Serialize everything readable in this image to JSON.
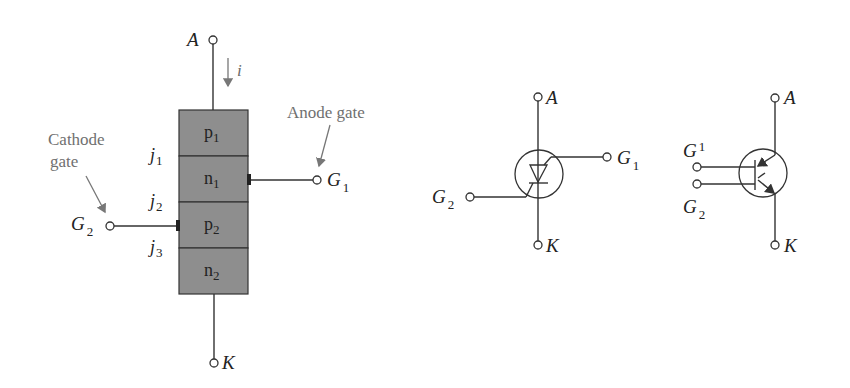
{
  "figure": {
    "structure": {
      "anode_label": "A",
      "cathode_label": "K",
      "current_label": "i",
      "layers": [
        {
          "name": "p",
          "sub": "1"
        },
        {
          "name": "n",
          "sub": "1"
        },
        {
          "name": "p",
          "sub": "2"
        },
        {
          "name": "n",
          "sub": "2"
        }
      ],
      "junctions": [
        {
          "name": "j",
          "sub": "1"
        },
        {
          "name": "j",
          "sub": "2"
        },
        {
          "name": "j",
          "sub": "3"
        }
      ],
      "anode_gate_caption": "Anode gate",
      "cathode_gate_caption_line1": "Cathode",
      "cathode_gate_caption_line2": "gate",
      "g1_label": "G",
      "g1_sub": "1",
      "g2_label": "G",
      "g2_sub": "2"
    },
    "symbol_scr": {
      "anode_label": "A",
      "cathode_label": "K",
      "g1_label": "G",
      "g1_sub": "1",
      "g2_label": "G",
      "g2_sub": "2"
    },
    "symbol_transistor": {
      "anode_label": "A",
      "cathode_label": "K",
      "g1_label": "G",
      "g1_sub": "1",
      "g2_label": "G",
      "g2_sub": "2"
    },
    "colors": {
      "layer_fill": "#8e8e8e",
      "line": "#333333",
      "annotation": "#707070"
    }
  }
}
